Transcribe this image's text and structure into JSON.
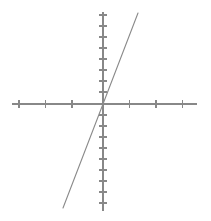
{
  "figure": {
    "name": "linear-function-graph",
    "width": 211,
    "height": 221,
    "background_color": "#ffffff",
    "stroke_color": "#888888",
    "line_color": "#8a8a8a",
    "axis_stroke_width": 1.1,
    "tick_stroke_width": 1.1,
    "line_stroke_width": 1.1
  },
  "chart_data": {
    "type": "line",
    "title": "",
    "subtitle": "",
    "xlabel": "",
    "ylabel": "",
    "grid": false,
    "legend": false,
    "legend_position": "none",
    "axes": {
      "origin_px": [
        103,
        104
      ],
      "x_axis": {
        "start_px": [
          12,
          104
        ],
        "end_px": [
          197,
          104
        ],
        "unit_px": 26.5,
        "tick_positions_px": [
          19,
          45.5,
          72,
          129.5,
          156,
          182.5
        ],
        "tick_values": [
          -3,
          -2,
          -1,
          1,
          2,
          3
        ],
        "tick_half_length_px": 4,
        "range": [
          -3.4,
          3.5
        ],
        "tick_labels_visible": false
      },
      "y_axis": {
        "start_px": [
          103,
          12
        ],
        "end_px": [
          103,
          211
        ],
        "unit_px": 11,
        "tick_positions_px": [
          15,
          26,
          37,
          48,
          59,
          70,
          81,
          92,
          115,
          126,
          137,
          148,
          159,
          170,
          181,
          192,
          203
        ],
        "tick_values": [
          8,
          7,
          6,
          5,
          4,
          3,
          2,
          1,
          -1,
          -2,
          -3,
          -4,
          -5,
          -6,
          -7,
          -8,
          -9
        ],
        "tick_half_length_px": 4,
        "range": [
          -9.3,
          8.4
        ],
        "tick_labels_visible": false
      }
    },
    "series": [
      {
        "name": "line",
        "kind": "straight-line",
        "slope_data": 6.3,
        "intercept_data": 0,
        "passes_through_origin": true,
        "endpoints_px": [
          [
            63,
            208
          ],
          [
            138,
            13
          ]
        ],
        "endpoints_data": [
          [
            -1.51,
            -9.45
          ],
          [
            1.32,
            8.27
          ]
        ],
        "x": [
          -1.51,
          1.32
        ],
        "values": [
          -9.45,
          8.27
        ]
      }
    ]
  }
}
